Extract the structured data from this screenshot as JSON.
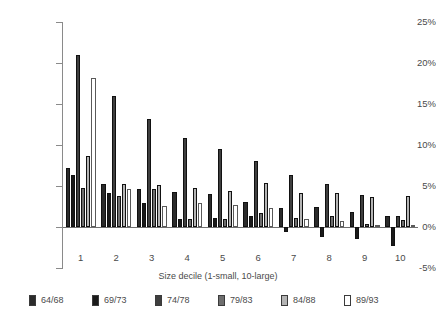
{
  "chart_data": {
    "type": "bar",
    "title": "",
    "subtitle": "",
    "xlabel": "Size decile (1-small, 10-large)",
    "ylabel": "",
    "categories": [
      "1",
      "2",
      "3",
      "4",
      "5",
      "6",
      "7",
      "8",
      "9",
      "10"
    ],
    "ylim": [
      -5,
      25
    ],
    "yticks": [
      -5,
      0,
      5,
      10,
      15,
      20,
      25
    ],
    "ytick_labels": [
      "-5%",
      "0%",
      "5%",
      "10%",
      "15%",
      "20%",
      "25%"
    ],
    "grid": false,
    "legend_position": "bottom",
    "series": [
      {
        "name": "64/68",
        "color": "#2b2b2b",
        "values": [
          7.2,
          5.3,
          4.6,
          4.3,
          4.0,
          3.1,
          2.3,
          2.4,
          1.8,
          1.4
        ]
      },
      {
        "name": "69/73",
        "color": "#1a1a1a",
        "values": [
          6.4,
          4.1,
          2.9,
          1.0,
          1.1,
          1.3,
          -0.6,
          -1.2,
          -1.5,
          -2.3
        ]
      },
      {
        "name": "74/78",
        "color": "#3f3f3f",
        "values": [
          21.0,
          16.0,
          13.2,
          10.8,
          9.5,
          8.0,
          6.3,
          5.2,
          3.9,
          1.3
        ]
      },
      {
        "name": "79/83",
        "color": "#6e6e6e",
        "values": [
          4.8,
          3.8,
          4.6,
          1.0,
          1.0,
          1.7,
          1.1,
          1.3,
          0.4,
          0.8
        ]
      },
      {
        "name": "84/88",
        "color": "#b4b4b4",
        "values": [
          8.7,
          5.2,
          5.1,
          4.8,
          4.4,
          5.4,
          4.1,
          4.2,
          3.7,
          3.8
        ]
      },
      {
        "name": "89/93",
        "color": "#ffffff",
        "values": [
          18.2,
          4.6,
          2.6,
          2.9,
          2.7,
          2.3,
          1.0,
          0.7,
          0.3,
          0.2
        ]
      }
    ]
  },
  "axis": {
    "x_title": "Size decile (1-small, 10-large)"
  }
}
